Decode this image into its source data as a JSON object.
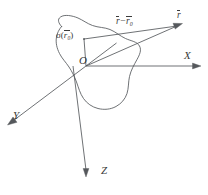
{
  "figure": {
    "background_color": "#ffffff",
    "stroke_color": "#55585c",
    "text_color": "#3a3a3a",
    "width": 208,
    "height": 195,
    "axes": [
      {
        "name": "x-axis",
        "label": "X",
        "direction": "right"
      },
      {
        "name": "y-axis",
        "label": "Y",
        "direction": "lower-left"
      },
      {
        "name": "z-axis",
        "label": "Z",
        "direction": "down"
      }
    ],
    "origin": {
      "label": "O",
      "x": 86,
      "y": 66
    },
    "labels": {
      "x_axis": "X",
      "y_axis": "Y",
      "z_axis": "Z",
      "origin": "O",
      "sigma_prefix": "σ(",
      "sigma_vector": "r",
      "sigma_subscript": "0",
      "sigma_suffix": ")",
      "field_vector": "r",
      "difference_first": "r",
      "difference_operator": "−",
      "difference_second": "r",
      "difference_subscript": "0"
    },
    "annotations": {
      "source_density": "σ(r̅0)",
      "field_point_vector": "r̅",
      "separation_vector": "r̅ − r̅0"
    }
  }
}
